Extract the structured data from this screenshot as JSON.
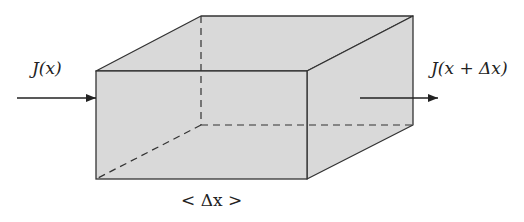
{
  "diagram": {
    "type": "control-volume-box",
    "colors": {
      "fill": "#d9d9d9",
      "stroke": "#333333",
      "background": "#ffffff"
    },
    "box": {
      "front": {
        "x1": 96,
        "y1": 71,
        "x2": 307,
        "y2": 179
      },
      "depth_offset": {
        "dx": 106,
        "dy": -55
      }
    },
    "labels": {
      "inflow": "J(x)",
      "outflow": "J(x + Δx)",
      "width": "< Δx >"
    },
    "arrows": {
      "inflow": {
        "x1": 17,
        "y1": 98,
        "x2": 96,
        "y2": 98
      },
      "outflow": {
        "x1": 360,
        "y1": 98,
        "x2": 438,
        "y2": 98
      }
    }
  }
}
